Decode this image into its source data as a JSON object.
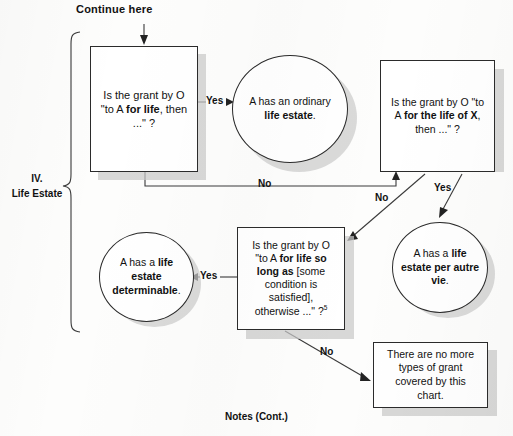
{
  "chart_title": "IV. Life Estate flowchart",
  "header": {
    "continue_label": "Continue here"
  },
  "section": {
    "number": "IV.",
    "name": "Life Estate"
  },
  "footer": {
    "notes_label": "Notes (Cont.)"
  },
  "nodes": {
    "q1": {
      "id": "question-for-life",
      "type": "decision-box",
      "line1": "Is the grant by O",
      "line2_pre": "\"to A ",
      "line2_bold": "for life",
      "line2_post": ", then",
      "line3": "...\" ?"
    },
    "r1": {
      "id": "result-ordinary-life-estate",
      "type": "result-circle",
      "line1": "A has an ordinary",
      "line2_bold": "life estate",
      "line2_post": "."
    },
    "q2": {
      "id": "question-life-of-x",
      "type": "decision-box",
      "line1": "Is the grant by O \"to",
      "line2_pre": "A ",
      "line2_bold": "for the life of X",
      "line2_post": ",",
      "line3": "then ...\" ?"
    },
    "r2": {
      "id": "result-per-autre-vie",
      "type": "result-circle",
      "line1_pre": "A has a ",
      "line1_bold": "life",
      "line2_bold": "estate per autre",
      "line3_bold": "vie",
      "line3_post": "."
    },
    "q3": {
      "id": "question-so-long-as",
      "type": "decision-box",
      "line1": "Is the grant by O",
      "line2_pre": "\"to A ",
      "line2_bold": "for life so",
      "line3_bold": "long as",
      "line3_post": " [some",
      "line4": "condition is",
      "line5": "satisfied],",
      "line6": "otherwise ...\" ?",
      "footnote": "5"
    },
    "r3": {
      "id": "result-life-estate-determinable",
      "type": "result-circle",
      "line1_pre": "A has a ",
      "line1_bold": "life",
      "line2_bold": "estate",
      "line3_bold": "determinable",
      "line3_post": "."
    },
    "end": {
      "id": "terminal-no-more-grants",
      "type": "terminal-box",
      "line1": "There are no more",
      "line2": "types of grant",
      "line3": "covered by this",
      "line4": "chart."
    }
  },
  "edges": {
    "q1_yes": "Yes",
    "q1_no": "No",
    "q2_no": "No",
    "q2_yes": "Yes",
    "q3_yes": "Yes",
    "q3_no": "No"
  },
  "colors": {
    "ink": "#111111",
    "line": "#3a3a3a",
    "shadow": "#c9c9c9",
    "paper": "#fdfdfc"
  }
}
